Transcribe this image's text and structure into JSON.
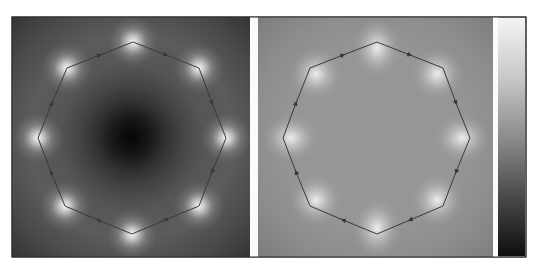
{
  "figure": {
    "panels": [
      {
        "id": "left",
        "description": "Scalar field contour map with dark central minimum and bright maxima at octagon vertices",
        "background_color": "#5a5a5a",
        "center_color": "#0a0a0a",
        "vertex_glow_color": "#f2f2f2",
        "path_color": "#3a3a3a",
        "vertices": [
          [
            133,
            42
          ],
          [
            199,
            68
          ],
          [
            226,
            138
          ],
          [
            199,
            206
          ],
          [
            132,
            234
          ],
          [
            65,
            206
          ],
          [
            38,
            138
          ],
          [
            67,
            68
          ]
        ],
        "arrow_direction": "clockwise"
      },
      {
        "id": "right",
        "description": "Scalar field contour map, uniform mid-gray interior with lobes at octagon vertices",
        "background_color": "#8a8a8a",
        "interior_color": "#979797",
        "vertex_glow_color": "#e8e8e8",
        "path_color": "#3a3a3a",
        "vertices": [
          [
            377,
            42
          ],
          [
            443,
            68
          ],
          [
            470,
            138
          ],
          [
            443,
            206
          ],
          [
            377,
            234
          ],
          [
            310,
            206
          ],
          [
            283,
            138
          ],
          [
            310,
            68
          ]
        ],
        "arrow_direction": "clockwise"
      }
    ],
    "colorbar": {
      "orientation": "vertical",
      "top_color": "#f4f4f4",
      "bottom_color": "#101010",
      "tick_labels": []
    }
  }
}
